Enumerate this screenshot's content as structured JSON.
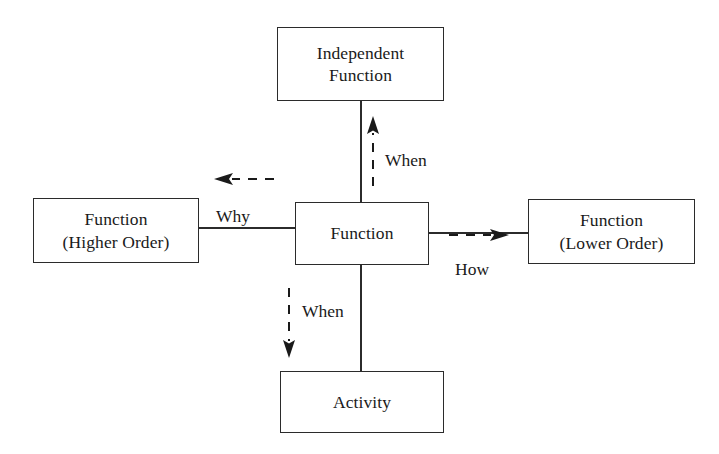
{
  "diagram": {
    "boxes": {
      "independent_function": {
        "line1": "Independent",
        "line2": "Function"
      },
      "function_higher_order": {
        "line1": "Function",
        "line2": "(Higher Order)"
      },
      "function_center": {
        "line1": "Function"
      },
      "function_lower_order": {
        "line1": "Function",
        "line2": "(Lower Order)"
      },
      "activity": {
        "line1": "Activity"
      }
    },
    "edge_labels": {
      "when_up": "When",
      "when_down": "When",
      "why": "Why",
      "how": "How"
    },
    "colors": {
      "stroke": "#2b2b2b",
      "text": "#1a1a1a",
      "background": "#ffffff"
    },
    "icons": {
      "arrow_up": "arrow-up-dashed-icon",
      "arrow_down": "arrow-down-dashed-icon",
      "arrow_left": "arrow-left-dashed-icon",
      "arrow_right": "arrow-right-dashed-icon"
    }
  }
}
